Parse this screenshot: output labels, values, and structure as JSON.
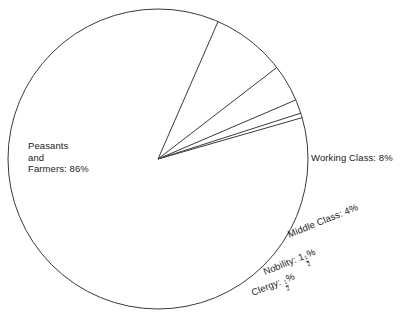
{
  "chart_data": {
    "type": "pie",
    "title": "",
    "categories": [
      "Peasants and Farmers",
      "Working Class",
      "Middle Class",
      "Nobility",
      "Clergy"
    ],
    "values": [
      86,
      8,
      4,
      1.5,
      0.5
    ],
    "value_labels": [
      "86%",
      "8%",
      "4%",
      "1½%",
      "½%"
    ],
    "start_angle_deg": -16,
    "direction": "clockwise",
    "legend": "none",
    "grid": false,
    "filled": false,
    "stroke_color": "#3a3a3a",
    "background_color": "#ffffff"
  },
  "labels": {
    "peasants": {
      "line1": "Peasants",
      "line2": "and",
      "line3": "Farmers:  86%"
    },
    "working": {
      "text": "Working Class: 8%"
    },
    "middle": {
      "text": "Middle Class: 4%"
    },
    "nobility": {
      "prefix": "Nobility: 1",
      "frac_num": "1",
      "frac_den": "2",
      "suffix": "%"
    },
    "clergy": {
      "prefix": "Clergy: ",
      "frac_num": "1",
      "frac_den": "2",
      "suffix": "%"
    }
  }
}
